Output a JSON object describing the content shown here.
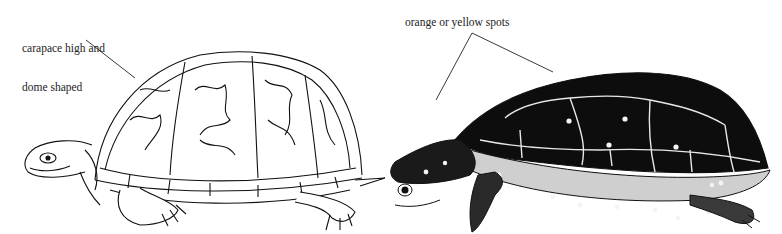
{
  "figure": {
    "left_panel": {
      "subject": "box turtle illustration",
      "label_line1": "carapace high and",
      "label_line2": "dome shaped"
    },
    "right_panel": {
      "subject": "spotted turtle illustration",
      "label": "orange or yellow spots"
    },
    "colors": {
      "ink": "#111111",
      "paper": "#ffffff",
      "spot": "#f4f4f4"
    }
  }
}
